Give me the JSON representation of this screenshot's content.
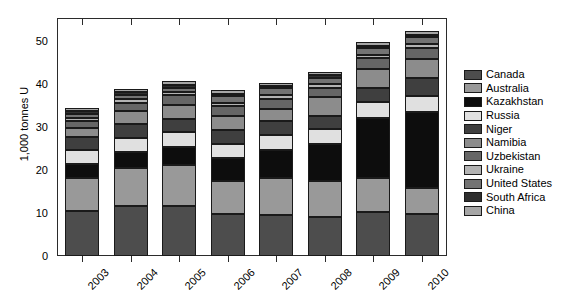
{
  "chart_data": {
    "type": "bar",
    "stacked": true,
    "title": "",
    "xlabel": "",
    "ylabel": "1,000 tonnes U",
    "categories": [
      "2003",
      "2004",
      "2005",
      "2006",
      "2007",
      "2008",
      "2009",
      "2010"
    ],
    "ylim": [
      0,
      55
    ],
    "yticks": [
      0,
      10,
      20,
      30,
      40,
      50
    ],
    "ytick_labels": [
      "0",
      "10",
      "20",
      "30",
      "40",
      "50"
    ],
    "grid": false,
    "legend_position": "right",
    "series": [
      {
        "name": "Canada",
        "color": "#4d4d4d",
        "values": [
          10.5,
          11.6,
          11.6,
          9.8,
          9.5,
          9.0,
          10.2,
          9.8
        ]
      },
      {
        "name": "Australia",
        "color": "#999999",
        "values": [
          7.6,
          8.9,
          9.5,
          7.6,
          8.6,
          8.4,
          7.9,
          5.9
        ]
      },
      {
        "name": "Kazakhstan",
        "color": "#0d0d0d",
        "values": [
          3.3,
          3.7,
          4.3,
          5.3,
          6.6,
          8.5,
          14.0,
          17.8
        ]
      },
      {
        "name": "Russia",
        "color": "#e0e0e0",
        "values": [
          3.2,
          3.2,
          3.4,
          3.2,
          3.4,
          3.5,
          3.6,
          3.6
        ]
      },
      {
        "name": "Niger",
        "color": "#3f3f3f",
        "values": [
          3.1,
          3.2,
          3.1,
          3.4,
          3.2,
          3.0,
          3.2,
          4.2
        ]
      },
      {
        "name": "Namibia",
        "color": "#8c8c8c",
        "values": [
          2.0,
          3.0,
          3.1,
          3.1,
          2.9,
          4.4,
          4.6,
          4.5
        ]
      },
      {
        "name": "Uzbekistan",
        "color": "#666666",
        "values": [
          1.6,
          2.0,
          2.3,
          2.3,
          2.3,
          2.3,
          2.4,
          2.4
        ]
      },
      {
        "name": "Ukraine",
        "color": "#b3b3b3",
        "values": [
          0.8,
          0.8,
          0.8,
          0.8,
          0.8,
          0.8,
          0.8,
          0.9
        ]
      },
      {
        "name": "United States",
        "color": "#737373",
        "values": [
          0.8,
          0.9,
          1.0,
          1.7,
          1.7,
          1.5,
          1.5,
          1.7
        ]
      },
      {
        "name": "South Africa",
        "color": "#2e2e2e",
        "values": [
          0.8,
          0.8,
          0.7,
          0.5,
          0.5,
          0.6,
          0.6,
          0.6
        ]
      },
      {
        "name": "China",
        "color": "#a6a6a6",
        "values": [
          0.7,
          0.7,
          0.8,
          0.8,
          0.7,
          0.8,
          0.8,
          0.8
        ]
      }
    ],
    "totals": [
      34.4,
      38.8,
      40.6,
      38.5,
      40.2,
      42.8,
      49.6,
      52.2
    ]
  },
  "legend": {
    "items": [
      {
        "label": "Canada"
      },
      {
        "label": "Australia"
      },
      {
        "label": "Kazakhstan"
      },
      {
        "label": "Russia"
      },
      {
        "label": "Niger"
      },
      {
        "label": "Namibia"
      },
      {
        "label": "Uzbekistan"
      },
      {
        "label": "Ukraine"
      },
      {
        "label": "United States"
      },
      {
        "label": "South Africa"
      },
      {
        "label": "China"
      }
    ]
  },
  "axes": {
    "y_axis_label": "1,000 tonnes U"
  }
}
